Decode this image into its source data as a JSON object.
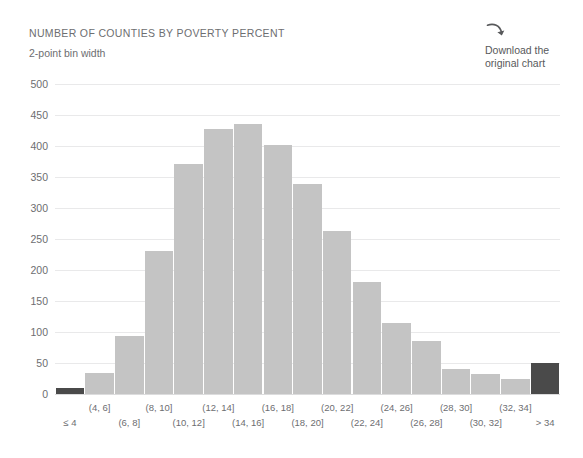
{
  "header": {
    "title": "NUMBER OF COUNTIES BY POVERTY PERCENT",
    "subtitle": "2-point bin width"
  },
  "download": {
    "icon": "curved-download-arrow-icon",
    "label": "Download the original chart"
  },
  "colors": {
    "bar": "#c4c4c4",
    "bar_highlight": "#4a4a4a",
    "gridline": "#e9e9ea",
    "text": "#6d6e71"
  },
  "chart_data": {
    "type": "bar",
    "title": "NUMBER OF COUNTIES BY POVERTY PERCENT",
    "subtitle": "2-point bin width",
    "xlabel": "",
    "ylabel": "",
    "ylim": [
      0,
      500
    ],
    "yticks": [
      0,
      50,
      100,
      150,
      200,
      250,
      300,
      350,
      400,
      450,
      500
    ],
    "grid": true,
    "legend": "none",
    "categories": [
      "≤ 4",
      "(4, 6]",
      "(6, 8]",
      "(8, 10]",
      "(10, 12]",
      "(12, 14]",
      "(14, 16]",
      "(16, 18]",
      "(18, 20]",
      "(20, 22]",
      "(22, 24]",
      "(24, 26]",
      "(26, 28]",
      "(28, 30]",
      "(30, 32]",
      "(32, 34]",
      "> 34"
    ],
    "values": [
      10,
      34,
      94,
      230,
      371,
      427,
      435,
      401,
      338,
      263,
      181,
      114,
      85,
      41,
      33,
      25,
      50
    ],
    "highlighted": [
      0,
      16
    ]
  }
}
